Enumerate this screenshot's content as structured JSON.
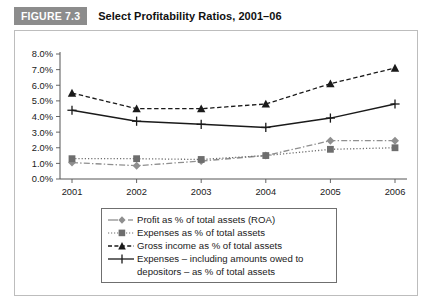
{
  "figure": {
    "badge": "FIGURE 7.3",
    "title": "Select Profitability Ratios, 2001–06"
  },
  "colors": {
    "badge_bg": "#8c8c8c",
    "badge_text": "#ffffff",
    "frame_border": "#bdbdbd",
    "legend_border": "#6f6f6f",
    "axis": "#555555",
    "series_profit": "#8f8f8f",
    "series_expenses": "#6e6e6e",
    "series_gross_income": "#1a1a1a",
    "series_expenses_depositors": "#1a1a1a"
  },
  "chart_data": {
    "type": "line",
    "title": "Select Profitability Ratios, 2001–06",
    "xlabel": "",
    "ylabel": "",
    "categories": [
      "2001",
      "2002",
      "2003",
      "2004",
      "2005",
      "2006"
    ],
    "ylim": [
      0.0,
      8.0
    ],
    "ytick_values": [
      0.0,
      1.0,
      2.0,
      3.0,
      4.0,
      5.0,
      6.0,
      7.0,
      8.0
    ],
    "ytick_labels": [
      "0.0%",
      "1.0%",
      "2.0%",
      "3.0%",
      "4.0%",
      "5.0%",
      "6.0%",
      "7.0%",
      "8.0%"
    ],
    "grid": false,
    "legend_position": "below",
    "series": [
      {
        "name": "Profit as % of total assets (ROA)",
        "marker": "diamond",
        "dash": "dashdot",
        "color": "#8f8f8f",
        "values": [
          1.05,
          0.85,
          1.15,
          1.5,
          2.45,
          2.45
        ]
      },
      {
        "name": "Expenses as % of total assets",
        "marker": "square",
        "dash": "dotted",
        "color": "#6e6e6e",
        "values": [
          1.3,
          1.3,
          1.25,
          1.5,
          1.9,
          2.0
        ]
      },
      {
        "name": "Gross income as % of total assets",
        "marker": "triangle",
        "dash": "dashed",
        "color": "#1a1a1a",
        "values": [
          5.5,
          4.5,
          4.5,
          4.8,
          6.1,
          7.1
        ]
      },
      {
        "name": "Expenses – including amounts owed to depositors – as % of total assets",
        "marker": "plus",
        "dash": "solid",
        "color": "#1a1a1a",
        "values": [
          4.4,
          3.7,
          3.5,
          3.3,
          3.9,
          4.8
        ]
      }
    ]
  },
  "legend": {
    "items": [
      {
        "label": "Profit as % of total assets (ROA)",
        "label2": ""
      },
      {
        "label": "Expenses as % of total assets",
        "label2": ""
      },
      {
        "label": "Gross income as % of total assets",
        "label2": ""
      },
      {
        "label": "Expenses – including amounts owed to",
        "label2": "depositors – as % of total assets"
      }
    ]
  }
}
